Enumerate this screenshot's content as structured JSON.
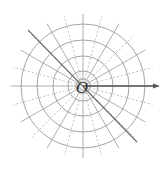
{
  "diagram": {
    "type": "polar-coordinate-grid",
    "origin_label": "O",
    "center": [
      83,
      86
    ],
    "circle_radii": [
      7,
      15,
      30,
      46,
      62
    ],
    "ray_step_degrees": 15,
    "ray_length": 72,
    "polar_axis": {
      "from": [
        83,
        86
      ],
      "to": [
        160,
        86
      ],
      "direction": "right"
    },
    "highlight_line": {
      "angle_degrees": 135,
      "from": [
        28,
        30
      ],
      "to": [
        137,
        142
      ]
    },
    "colors": {
      "grid": "#9a9a9a",
      "grid_dashed": "#b0b0b0",
      "axis": "#555555",
      "highlight_line": "#6a6a6a",
      "label": "#333333",
      "background": "#ffffff"
    }
  }
}
